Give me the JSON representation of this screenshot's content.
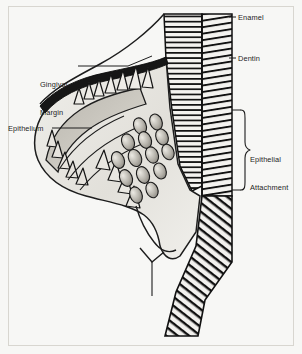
{
  "figure": {
    "background_color": "#f7f7f5",
    "ink_color": "#1d1d1d",
    "labels": {
      "enamel": "Enamel",
      "dentin": "Dentin",
      "gingival_margin_line1": "Gingival",
      "gingival_margin_line2": "Margin",
      "epithelium": "Epithelium",
      "epithelial_attachment_line1": "Epithelial",
      "epithelial_attachment_line2": "Attachment"
    },
    "icons": {
      "brace": "curly-brace-bracket",
      "leader": "leader-line"
    }
  }
}
